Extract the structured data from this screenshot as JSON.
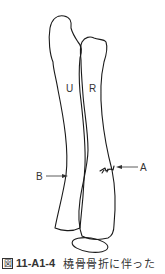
{
  "diagram": {
    "labels": {
      "ulna": "U",
      "radius": "R",
      "arrow_a": "A",
      "arrow_b": "B"
    },
    "colors": {
      "stroke": "#1a1a1a",
      "text": "#333333"
    }
  },
  "caption": {
    "icon": "図",
    "number": "11-A1-4",
    "text": "橈骨骨折に伴った"
  }
}
